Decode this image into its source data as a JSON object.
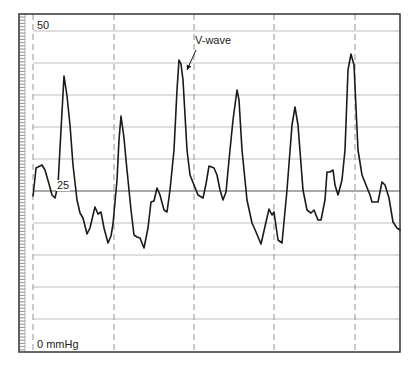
{
  "chart_data": {
    "type": "line",
    "title": "",
    "xlabel": "",
    "ylabel": "Pressure (mmHg)",
    "y_unit": "mmHg",
    "ylim": [
      0,
      50
    ],
    "y_tick_labels": [
      {
        "value": 50,
        "text": "50"
      },
      {
        "value": 25,
        "text": "25"
      },
      {
        "value": 0,
        "text": "0 mmHg"
      }
    ],
    "grid": true,
    "grid_y_step": 5,
    "vertical_dashed_markers": 5,
    "annotations": [
      {
        "text": "V-wave",
        "points_to_peak_index": 2
      }
    ],
    "series": [
      {
        "name": "pressure waveform",
        "peaks_mmHg": [
          43,
          37,
          45,
          38,
          37.7,
          46
        ],
        "description": "Atrial pressure waveform with prominent V-waves (~37-46 mmHg), baseline troughs ~16-21 mmHg"
      }
    ]
  },
  "labels": {
    "y_top": "50",
    "y_mid": "25",
    "y_bottom": "0 mmHg",
    "annotation": "V-wave"
  },
  "colors": {
    "line": "#1a1a1a",
    "grid": "#b5b5b5",
    "grid_mid": "#555555",
    "frame": "#333333",
    "dashed": "#888888"
  },
  "layout": {
    "frame": {
      "x": 19,
      "y": 14,
      "w": 381,
      "h": 338
    },
    "y0_px": 351,
    "y50_px": 31,
    "dashed_x": [
      33,
      114,
      194,
      274,
      355
    ],
    "arrow": {
      "x1": 196,
      "y1": 50,
      "x2": 187,
      "y2": 70
    }
  },
  "waveform_px": [
    [
      33,
      196
    ],
    [
      35,
      178
    ],
    [
      36,
      168
    ],
    [
      42,
      165
    ],
    [
      45,
      170
    ],
    [
      49,
      184
    ],
    [
      52,
      195
    ],
    [
      55,
      198
    ],
    [
      58,
      185
    ],
    [
      61,
      130
    ],
    [
      64,
      76
    ],
    [
      67,
      96
    ],
    [
      70,
      125
    ],
    [
      73,
      165
    ],
    [
      77,
      200
    ],
    [
      80,
      213
    ],
    [
      83,
      218
    ],
    [
      87,
      234
    ],
    [
      90,
      228
    ],
    [
      93,
      215
    ],
    [
      95,
      207
    ],
    [
      98,
      214
    ],
    [
      101,
      212
    ],
    [
      104,
      228
    ],
    [
      108,
      243
    ],
    [
      111,
      236
    ],
    [
      113,
      224
    ],
    [
      117,
      180
    ],
    [
      119,
      140
    ],
    [
      121,
      116
    ],
    [
      124,
      138
    ],
    [
      126,
      160
    ],
    [
      131,
      210
    ],
    [
      134,
      235
    ],
    [
      137,
      237
    ],
    [
      140,
      238
    ],
    [
      144,
      248
    ],
    [
      148,
      228
    ],
    [
      151,
      202
    ],
    [
      154,
      201
    ],
    [
      157,
      188
    ],
    [
      160,
      195
    ],
    [
      164,
      210
    ],
    [
      167,
      212
    ],
    [
      170,
      190
    ],
    [
      174,
      150
    ],
    [
      177,
      90
    ],
    [
      179,
      60
    ],
    [
      181,
      64
    ],
    [
      183,
      80
    ],
    [
      187,
      150
    ],
    [
      190,
      175
    ],
    [
      194,
      185
    ],
    [
      198,
      195
    ],
    [
      203,
      198
    ],
    [
      206,
      184
    ],
    [
      209,
      166
    ],
    [
      214,
      168
    ],
    [
      217,
      175
    ],
    [
      220,
      190
    ],
    [
      223,
      200
    ],
    [
      226,
      192
    ],
    [
      229,
      160
    ],
    [
      233,
      120
    ],
    [
      237,
      90
    ],
    [
      239,
      100
    ],
    [
      242,
      150
    ],
    [
      247,
      200
    ],
    [
      252,
      223
    ],
    [
      256,
      232
    ],
    [
      261,
      244
    ],
    [
      266,
      222
    ],
    [
      269,
      209
    ],
    [
      272,
      215
    ],
    [
      274,
      212
    ],
    [
      278,
      240
    ],
    [
      282,
      243
    ],
    [
      287,
      190
    ],
    [
      292,
      125
    ],
    [
      295,
      107
    ],
    [
      298,
      125
    ],
    [
      303,
      190
    ],
    [
      307,
      210
    ],
    [
      311,
      213
    ],
    [
      314,
      210
    ],
    [
      318,
      220
    ],
    [
      321,
      220
    ],
    [
      325,
      200
    ],
    [
      327,
      172
    ],
    [
      330,
      172
    ],
    [
      333,
      170
    ],
    [
      335,
      185
    ],
    [
      338,
      195
    ],
    [
      342,
      180
    ],
    [
      345,
      150
    ],
    [
      348,
      70
    ],
    [
      351,
      54
    ],
    [
      354,
      65
    ],
    [
      358,
      150
    ],
    [
      362,
      175
    ],
    [
      366,
      185
    ],
    [
      370,
      195
    ],
    [
      372,
      202
    ],
    [
      378,
      202
    ],
    [
      382,
      182
    ],
    [
      385,
      185
    ],
    [
      389,
      198
    ],
    [
      393,
      222
    ],
    [
      397,
      228
    ],
    [
      400,
      230
    ]
  ]
}
